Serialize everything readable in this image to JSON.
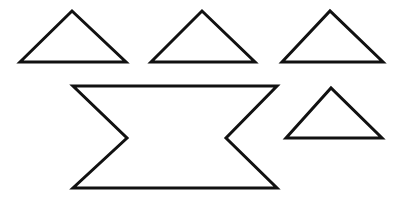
{
  "figure": {
    "canvas": {
      "width": 404,
      "height": 199
    },
    "background_color": "#ffffff",
    "stroke_color": "#111111",
    "stroke_width": 3,
    "fill": "none",
    "shape_count": 5
  },
  "shapes": [
    {
      "id": "triangle-top-left",
      "label": "Triangle 1",
      "kind": "triangle",
      "orientation": "apex-up",
      "points": "20,62 72,11 126,62",
      "apex": {
        "x": 72,
        "y": 11
      },
      "base_left": {
        "x": 20,
        "y": 62
      },
      "base_right": {
        "x": 126,
        "y": 62
      },
      "base_width": 106,
      "height": 51
    },
    {
      "id": "triangle-top-middle",
      "label": "Triangle 2",
      "kind": "triangle",
      "orientation": "apex-up",
      "points": "151,62 202,11 255,62",
      "apex": {
        "x": 202,
        "y": 11
      },
      "base_left": {
        "x": 151,
        "y": 62
      },
      "base_right": {
        "x": 255,
        "y": 62
      },
      "base_width": 104,
      "height": 51
    },
    {
      "id": "triangle-top-right",
      "label": "Triangle 3",
      "kind": "triangle",
      "orientation": "apex-up",
      "points": "282,62 330,11 383,62",
      "apex": {
        "x": 330,
        "y": 11
      },
      "base_left": {
        "x": 282,
        "y": 62
      },
      "base_right": {
        "x": 383,
        "y": 62
      },
      "base_width": 101,
      "height": 51
    },
    {
      "id": "hexagon-concave-bowtie",
      "label": "Concave hexagon (notched bowtie)",
      "kind": "concave-hexagon",
      "orientation": "horizontal",
      "points": "73,86 277,86 226,138 277,188 73,188 127,138",
      "vertices": [
        {
          "name": "top-left",
          "x": 73,
          "y": 86
        },
        {
          "name": "top-right",
          "x": 277,
          "y": 86
        },
        {
          "name": "right-notch-vertex",
          "x": 226,
          "y": 138
        },
        {
          "name": "bottom-right",
          "x": 277,
          "y": 188
        },
        {
          "name": "bottom-left",
          "x": 73,
          "y": 188
        },
        {
          "name": "left-notch-vertex",
          "x": 127,
          "y": 138
        }
      ],
      "width": 204,
      "height": 102
    },
    {
      "id": "triangle-bottom-right",
      "label": "Triangle 4",
      "kind": "triangle",
      "orientation": "apex-up",
      "points": "286,138 331,88 382,138",
      "apex": {
        "x": 331,
        "y": 88
      },
      "base_left": {
        "x": 286,
        "y": 138
      },
      "base_right": {
        "x": 382,
        "y": 138
      },
      "base_width": 96,
      "height": 50
    }
  ]
}
